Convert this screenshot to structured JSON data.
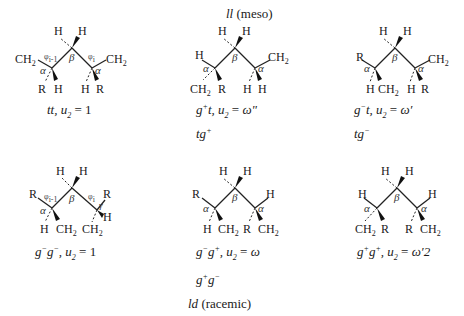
{
  "figure": {
    "group_labels": {
      "meso": {
        "abbr": "ll",
        "paren": "(meso)"
      },
      "racemic": {
        "abbr": "ld",
        "paren": "(racemic)"
      }
    },
    "structures": [
      {
        "id": "tt",
        "caption": {
          "state": "tt",
          "u_label": "u",
          "u_sub": "2",
          "eq": "=",
          "value": "1"
        },
        "alt_caption": "",
        "atoms": {
          "top_left": "H",
          "top_right": "H",
          "left": "CH2",
          "right": "CH2",
          "left_down1": "R",
          "left_down2": "H",
          "right_down1": "H",
          "right_down2": "R"
        },
        "angle_labels": {
          "alpha": "α",
          "beta": "β",
          "phi_left": "φi-1",
          "phi_right": "φi"
        }
      },
      {
        "id": "g+t",
        "caption": {
          "state": "g+t",
          "u_label": "u",
          "u_sub": "2",
          "eq": "=",
          "value": "ω\""
        },
        "alt_caption": "tg+",
        "atoms": {
          "top_left": "H",
          "top_right": "H",
          "left": "H",
          "right": "CH2",
          "left_down1": "CH2",
          "left_down2": "R",
          "right_down1": "H",
          "right_down2": "H"
        },
        "angle_labels": {
          "alpha": "α",
          "beta": "β"
        }
      },
      {
        "id": "g-t",
        "caption": {
          "state": "g−t",
          "u_label": "u",
          "u_sub": "2",
          "eq": "=",
          "value": "ω′"
        },
        "alt_caption": "tg−",
        "atoms": {
          "top_left": "H",
          "top_right": "H",
          "left": "R",
          "right": "CH2",
          "left_down1": "H",
          "left_down2": "CH2",
          "right_down1": "H",
          "right_down2": "R"
        },
        "angle_labels": {
          "alpha": "α",
          "beta": "β"
        }
      },
      {
        "id": "g-g-",
        "caption": {
          "state": "g−g−",
          "u_label": "u",
          "u_sub": "2",
          "eq": "=",
          "value": "1"
        },
        "alt_caption": "",
        "atoms": {
          "top_left": "H",
          "top_right": "H",
          "left": "R",
          "right": "R",
          "left_down1": "H",
          "left_down2": "CH2",
          "right_down1": "CH2",
          "right_down2": "H"
        },
        "angle_labels": {
          "alpha": "α",
          "beta": "β",
          "phi_left": "φi-1",
          "phi_right": "φi",
          "gamma": "γ"
        }
      },
      {
        "id": "g-g+",
        "caption": {
          "state": "g−g+",
          "u_label": "u",
          "u_sub": "2",
          "eq": "=",
          "value": "ω"
        },
        "alt_caption": "g+g−",
        "atoms": {
          "top_left": "H",
          "top_right": "H",
          "left": "R",
          "right": "H",
          "left_down1": "H",
          "left_down2": "CH2",
          "right_down1": "R",
          "right_down2": "CH2"
        },
        "angle_labels": {
          "alpha": "α",
          "beta": "β"
        }
      },
      {
        "id": "g+g+",
        "caption": {
          "state": "g+g+",
          "u_label": "u",
          "u_sub": "2",
          "eq": "=",
          "value": "ω′2"
        },
        "alt_caption": "",
        "atoms": {
          "top_left": "H",
          "top_right": "H",
          "left": "H",
          "right": "H",
          "left_down1": "CH2",
          "left_down2": "R",
          "right_down1": "R",
          "right_down2": "CH2"
        },
        "angle_labels": {
          "alpha": "α",
          "beta": "β"
        }
      }
    ]
  }
}
